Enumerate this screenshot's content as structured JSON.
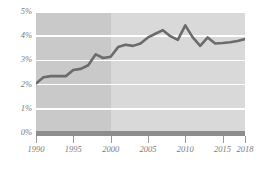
{
  "chart_data": {
    "type": "line",
    "title": "",
    "subtitle": "",
    "xlabel": "",
    "ylabel": "",
    "xlim": [
      1990,
      2018
    ],
    "ylim": [
      0,
      5
    ],
    "grid": true,
    "legend": null,
    "y_ticks": [
      0,
      1,
      2,
      3,
      4,
      5
    ],
    "y_tick_labels": [
      "0%",
      "1%",
      "2%",
      "3%",
      "4%",
      "5%"
    ],
    "x_ticks": [
      1990,
      1995,
      2000,
      2005,
      2010,
      2015,
      2018
    ],
    "x_tick_labels": [
      "1990",
      "1995",
      "2000",
      "2005",
      "2010",
      "2015",
      "2018"
    ],
    "x": [
      1990,
      1991,
      1992,
      1993,
      1994,
      1995,
      1996,
      1997,
      1998,
      1999,
      2000,
      2001,
      2002,
      2003,
      2004,
      2005,
      2006,
      2007,
      2008,
      2009,
      2010,
      2011,
      2012,
      2013,
      2014,
      2015,
      2016,
      2017,
      2018
    ],
    "values": [
      2.05,
      2.3,
      2.35,
      2.35,
      2.35,
      2.6,
      2.65,
      2.8,
      3.25,
      3.1,
      3.15,
      3.55,
      3.65,
      3.6,
      3.7,
      3.95,
      4.1,
      4.25,
      4.0,
      3.85,
      4.45,
      3.95,
      3.6,
      3.95,
      3.7,
      3.72,
      3.75,
      3.8,
      3.88
    ],
    "series": [
      {
        "name": "series-1",
        "values": [
          2.05,
          2.3,
          2.35,
          2.35,
          2.35,
          2.6,
          2.65,
          2.8,
          3.25,
          3.1,
          3.15,
          3.55,
          3.65,
          3.6,
          3.7,
          3.95,
          4.1,
          4.25,
          4.0,
          3.85,
          4.45,
          3.95,
          3.6,
          3.95,
          3.7,
          3.72,
          3.75,
          3.8,
          3.88
        ],
        "color": "#6b6b6b"
      }
    ],
    "shaded_regions": [
      {
        "name": "early-period",
        "from": 1990,
        "to": 2000,
        "color": "#c9c9c9"
      },
      {
        "name": "late-period",
        "from": 2000,
        "to": 2018,
        "color": "#d9d9d9"
      }
    ],
    "colors": {
      "line": "#6b6b6b",
      "band_early": "#c9c9c9",
      "band_late": "#d9d9d9",
      "gridline": "#ffffff",
      "baseline": "#8d8d8d",
      "tick": "#9a9a9a",
      "axis_text": "#7c7c7c",
      "background": "#ffffff"
    }
  }
}
